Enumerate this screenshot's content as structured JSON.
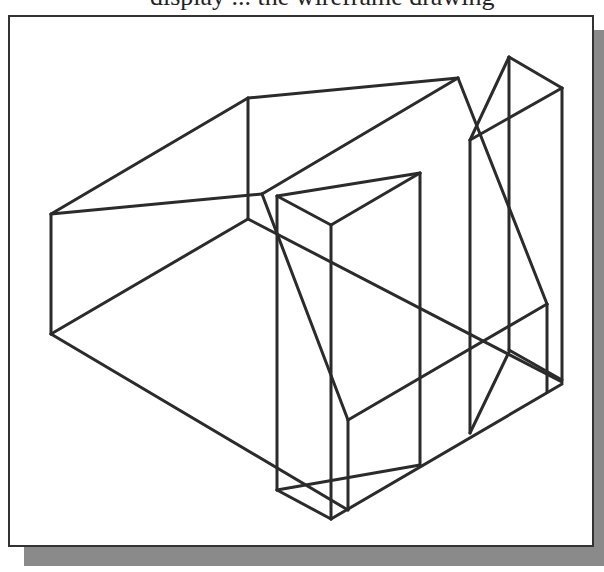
{
  "caption": {
    "text": "display ... the wireframe drawing"
  },
  "figure": {
    "stroke_color": "#2b2b2b",
    "frame_border_color": "#333333",
    "shadow_color": "#8a8a8a",
    "background_color": "#ffffff"
  }
}
